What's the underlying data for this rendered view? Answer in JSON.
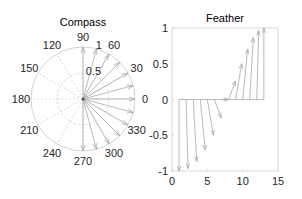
{
  "colors": {
    "grid": "#c8c8c8",
    "arrow": "#a8a8a8",
    "axis": "#d0d0d0",
    "text": "#262626"
  },
  "chart_data": [
    {
      "type": "compass",
      "title": "Compass",
      "angle_tick_labels": [
        "0",
        "30",
        "60",
        "90",
        "120",
        "150",
        "180",
        "210",
        "240",
        "270",
        "300",
        "330"
      ],
      "radial_tick_labels": [
        "0.5",
        "1"
      ],
      "rlim": [
        0,
        1
      ],
      "grid": true,
      "arrows": {
        "angles_deg": [
          -90,
          -75,
          -60,
          -45,
          -30,
          -15,
          0,
          15,
          30,
          45,
          60,
          75,
          90
        ],
        "magnitudes": [
          1,
          1,
          1,
          1,
          1,
          1,
          1,
          1,
          1,
          1,
          1,
          1,
          1
        ]
      }
    },
    {
      "type": "feather",
      "title": "Feather",
      "xlabel": "",
      "ylabel": "",
      "xlim": [
        0,
        15
      ],
      "ylim": [
        -1,
        1
      ],
      "xticks": [
        "0",
        "5",
        "10",
        "15"
      ],
      "yticks": [
        "-1",
        "-0.5",
        "0",
        "0.5",
        "1"
      ],
      "x": [
        1,
        2,
        3,
        4,
        5,
        6,
        7,
        8,
        9,
        10,
        11,
        12,
        13
      ],
      "series": [
        {
          "name": "u",
          "values": [
            0,
            0.259,
            0.5,
            0.707,
            0.866,
            0.966,
            1,
            0.966,
            0.866,
            0.707,
            0.5,
            0.259,
            0
          ]
        },
        {
          "name": "v",
          "values": [
            -1,
            -0.966,
            -0.866,
            -0.707,
            -0.5,
            -0.259,
            0,
            0.259,
            0.5,
            0.707,
            0.866,
            0.966,
            1
          ]
        }
      ],
      "grid": false
    }
  ]
}
